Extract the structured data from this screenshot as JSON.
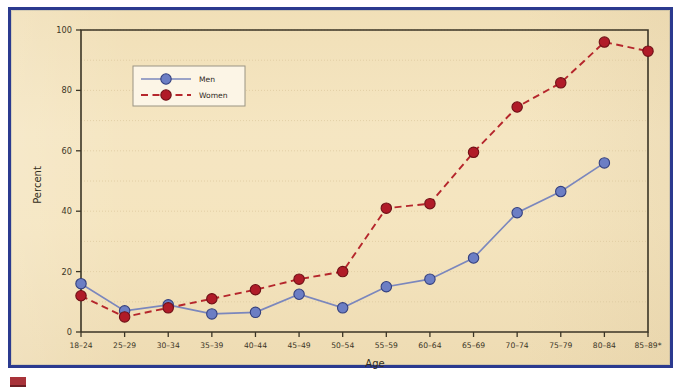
{
  "chart_data": {
    "type": "line",
    "title": "",
    "xlabel": "Age",
    "ylabel": "Percent",
    "ylim": [
      0,
      100
    ],
    "yticks": [
      0,
      20,
      40,
      60,
      80,
      100
    ],
    "grid": true,
    "grid_interval": 10,
    "legend_position": "upper-left-inside",
    "categories": [
      "18–24",
      "25–29",
      "30–34",
      "35–39",
      "40–44",
      "45–49",
      "50–54",
      "55–59",
      "60–64",
      "65–69",
      "70–74",
      "75–79",
      "80–84",
      "85–89*"
    ],
    "series": [
      {
        "name": "Men",
        "color": "#6c7ec4",
        "line_style": "solid",
        "marker": "circle",
        "values": [
          16,
          7,
          9,
          6,
          6.5,
          12.5,
          8,
          15,
          17.5,
          24.5,
          39.5,
          46.5,
          56,
          null
        ]
      },
      {
        "name": "Women",
        "color": "#b01b28",
        "line_style": "dashed",
        "marker": "circle",
        "values": [
          12,
          5,
          8,
          11,
          14,
          17.5,
          20,
          41,
          42.5,
          59.5,
          74.5,
          82.5,
          96,
          93
        ]
      }
    ]
  },
  "axis": {
    "y_tick_labels": [
      "0",
      "20",
      "40",
      "60",
      "80",
      "100"
    ],
    "y_title": "Percent",
    "x_title": "Age"
  },
  "legend": {
    "entries": [
      {
        "label": "Men"
      },
      {
        "label": "Women"
      }
    ]
  },
  "colors": {
    "background": "#f4e3bb",
    "border": "#2b3a8f",
    "men": "#6c7ec4",
    "women": "#b01b28",
    "axis": "#3b3526",
    "grid": "#ddc9a0"
  }
}
